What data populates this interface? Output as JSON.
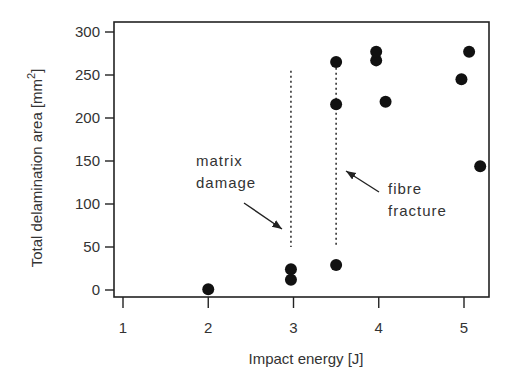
{
  "chart_data": {
    "type": "scatter",
    "title": "",
    "xlabel": "Impact energy [J]",
    "ylabel": "Total delamination area [mm2]",
    "ylabel_base": "Total delamination area [mm",
    "ylabel_sup": "2",
    "ylabel_close": "]",
    "xlim": [
      0.9,
      5.3
    ],
    "ylim": [
      -8,
      310
    ],
    "xticks": [
      1,
      2,
      3,
      4,
      5
    ],
    "yticks": [
      0,
      50,
      100,
      150,
      200,
      250,
      300
    ],
    "grid": false,
    "legend": null,
    "series": [
      {
        "name": "measurements",
        "marker": "filled-circle",
        "color": "#111111",
        "points": [
          {
            "x": 2.0,
            "y": 1
          },
          {
            "x": 2.97,
            "y": 12
          },
          {
            "x": 2.97,
            "y": 24
          },
          {
            "x": 3.5,
            "y": 29
          },
          {
            "x": 3.5,
            "y": 216
          },
          {
            "x": 3.5,
            "y": 265
          },
          {
            "x": 3.97,
            "y": 267
          },
          {
            "x": 3.97,
            "y": 277
          },
          {
            "x": 4.08,
            "y": 219
          },
          {
            "x": 4.97,
            "y": 245
          },
          {
            "x": 5.06,
            "y": 277
          },
          {
            "x": 5.19,
            "y": 144
          }
        ]
      }
    ],
    "annotations": [
      {
        "text_lines": [
          "matrix",
          "damage"
        ],
        "vline_x": 2.97,
        "vline_y": [
          50,
          255
        ],
        "arrow_to": {
          "x": 2.92,
          "y": 62
        }
      },
      {
        "text_lines": [
          "fibre",
          "fracture"
        ],
        "vline_x": 3.5,
        "vline_y": [
          50,
          270
        ],
        "arrow_to": {
          "x": 3.55,
          "y": 137
        }
      }
    ]
  }
}
